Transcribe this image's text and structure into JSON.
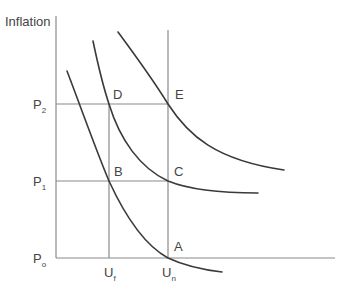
{
  "diagram": {
    "type": "phillips-curve-shifts",
    "y_axis_label": "Inflation",
    "price_levels": [
      {
        "id": "P0",
        "base": "P",
        "sub": "o",
        "y": 258
      },
      {
        "id": "P1",
        "base": "P",
        "sub": "1",
        "y": 181
      },
      {
        "id": "P2",
        "base": "P",
        "sub": "2",
        "y": 104
      }
    ],
    "unemployment_levels": [
      {
        "id": "Uf",
        "base": "U",
        "sub": "f",
        "x": 109
      },
      {
        "id": "Un",
        "base": "U",
        "sub": "n",
        "x": 168
      }
    ],
    "points": [
      {
        "label": "A",
        "at": [
          "Un",
          "P0"
        ]
      },
      {
        "label": "B",
        "at": [
          "Uf",
          "P1"
        ]
      },
      {
        "label": "C",
        "at": [
          "Un",
          "P1"
        ]
      },
      {
        "label": "D",
        "at": [
          "Uf",
          "P2"
        ]
      },
      {
        "label": "E",
        "at": [
          "Un",
          "P2"
        ]
      }
    ],
    "curves": [
      {
        "name": "short-run-curve-1",
        "passes_through": [
          "B",
          "A"
        ]
      },
      {
        "name": "short-run-curve-2",
        "passes_through": [
          "D",
          "C"
        ]
      },
      {
        "name": "short-run-curve-3",
        "passes_through": [
          "E"
        ]
      }
    ],
    "colors": {
      "axis": "#8a8a8a",
      "curve": "#3a3a3a",
      "text": "#444444"
    }
  }
}
